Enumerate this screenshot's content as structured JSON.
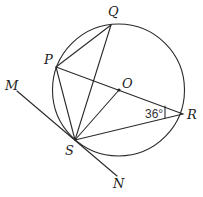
{
  "diagram": {
    "title": "",
    "circle": {
      "center": "O",
      "cx": 118.5,
      "cy": 90,
      "r": 66
    },
    "points": {
      "P": {
        "label": "P",
        "x": 56,
        "y": 67
      },
      "Q": {
        "label": "Q",
        "x": 111,
        "y": 25
      },
      "O": {
        "label": "O",
        "x": 119,
        "y": 90
      },
      "R": {
        "label": "R",
        "x": 183,
        "y": 114
      },
      "S": {
        "label": "S",
        "x": 75,
        "y": 140
      },
      "M": {
        "label": "M",
        "x": 17,
        "y": 91
      },
      "N": {
        "label": "N",
        "x": 117,
        "y": 176
      }
    },
    "segments": [
      "PQ",
      "PR",
      "PS",
      "QS",
      "OS",
      "SR",
      "MN"
    ],
    "tangent": {
      "label": "MN",
      "touches_at": "S"
    },
    "angle_marks": [
      {
        "vertex": "R",
        "between": [
          "P",
          "S"
        ],
        "text": "36°"
      }
    ]
  }
}
